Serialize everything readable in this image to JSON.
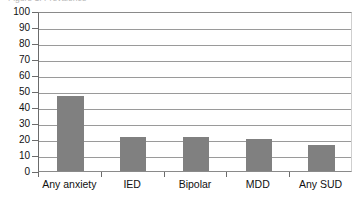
{
  "figure": {
    "caption_clipped": "Figure 1.  Prevalence"
  },
  "chart_data": {
    "type": "bar",
    "title": "",
    "xlabel": "",
    "ylabel": "",
    "categories": [
      "Any anxiety",
      "IED",
      "Bipolar",
      "MDD",
      "Any SUD"
    ],
    "values": [
      47,
      21,
      21,
      20,
      16
    ],
    "ylim": [
      0,
      100
    ],
    "yticks": [
      0,
      10,
      20,
      30,
      40,
      50,
      60,
      70,
      80,
      90,
      100
    ],
    "ytick_labels": [
      "0",
      "10",
      "20",
      "30",
      "40",
      "50",
      "60",
      "70",
      "80",
      "90",
      "100"
    ],
    "grid": true,
    "grid_axis": "y",
    "legend": false,
    "legend_position": "none",
    "bar_color": "#808080",
    "axis_color": "#6b6b6b",
    "gridline_color": "#9a9a9a",
    "background": "#ffffff"
  }
}
